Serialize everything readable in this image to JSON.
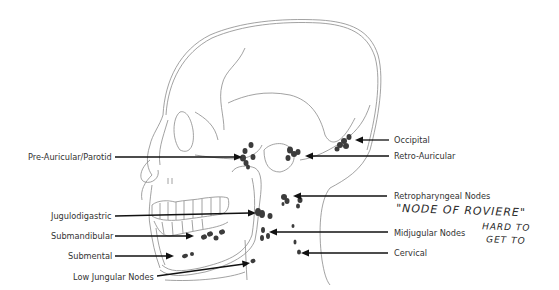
{
  "figure": {
    "labels_left": [
      {
        "id": "pre-auricular",
        "text": "Pre-Auricular/Parotid"
      },
      {
        "id": "jugulodigastric",
        "text": "Jugulodigastric"
      },
      {
        "id": "submandibular",
        "text": "Submandibular"
      },
      {
        "id": "submental",
        "text": "Submental"
      },
      {
        "id": "low-jugular",
        "text": "Low Jungular Nodes"
      }
    ],
    "labels_right": [
      {
        "id": "occipital",
        "text": "Occipital"
      },
      {
        "id": "retro-auricular",
        "text": "Retro-Auricular"
      },
      {
        "id": "retropharyngeal",
        "text": "Retropharyngeal Nodes"
      },
      {
        "id": "midjugular",
        "text": "Midjugular Nodes"
      },
      {
        "id": "cervical",
        "text": "Cervical"
      }
    ],
    "handwritten_notes": [
      "\"NODE OF ROVIERE\"",
      "HARD TO",
      "GET TO"
    ],
    "colors": {
      "outline": "#8a8a8a",
      "arrow": "#111111",
      "node": "#3c3c3c",
      "label": "#333333"
    }
  }
}
